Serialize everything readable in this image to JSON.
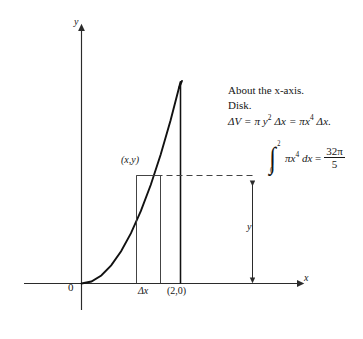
{
  "figure": {
    "title_note": {
      "line1": "About the x-axis.",
      "line2": "Disk.",
      "line3_lhs": "ΔV = π y",
      "line3_exp1": "2",
      "line3_mid": " Δx = πx",
      "line3_exp2": "4",
      "line3_end": " Δx."
    },
    "integral": {
      "upper_limit": "2",
      "lower_limit": "0",
      "integrand": "πx",
      "integrand_exp": "4",
      "differential": "dx",
      "equals": "=",
      "result_numerator": "32π",
      "result_denominator": "5",
      "full_text": "∫₀² πx⁴ dx = 32π/5"
    },
    "labels": {
      "point_xy": "(x,y)",
      "delta_x": "Δx",
      "point_2_0": "(2,0)",
      "origin": "0",
      "y_axis": "y",
      "x_axis": "x",
      "height_y": "y"
    },
    "colors": {
      "curve": "#111111",
      "axis": "#2b2b2b",
      "strip": "#3a3a3a",
      "dashed": "#444444",
      "background": "#ffffff"
    }
  },
  "chart_data": {
    "type": "line",
    "title": "",
    "xlabel": "x",
    "ylabel": "y",
    "function": "y = x^2",
    "x": [
      0,
      0.2,
      0.4,
      0.6,
      0.8,
      1.0,
      1.2,
      1.4,
      1.6,
      1.8,
      2.0
    ],
    "values": [
      0,
      0.04,
      0.16,
      0.36,
      0.64,
      1.0,
      1.44,
      1.96,
      2.56,
      3.24,
      4.0
    ],
    "xlim": [
      0,
      2.2
    ],
    "ylim": [
      0,
      4.4
    ],
    "grid": false,
    "legend": null,
    "annotations": [
      {
        "text": "(x,y)",
        "x": 1.35,
        "y": 2.05,
        "note": "point on curve at top-left of representative strip"
      },
      {
        "text": "Δx",
        "x": 1.5,
        "y": 0,
        "note": "width of representative rectangle, below axis"
      },
      {
        "text": "(2,0)",
        "x": 2.0,
        "y": 0,
        "note": "right endpoint of region on x-axis"
      },
      {
        "text": "0",
        "x": 0,
        "y": 0,
        "note": "origin"
      },
      {
        "text": "y",
        "x": 2.9,
        "y": 1.05,
        "note": "double-headed arrow measuring radius of disk"
      }
    ],
    "shapes": [
      {
        "kind": "rect-strip",
        "x_left": 1.26,
        "x_right": 1.58,
        "y_top": 2.02,
        "y_bottom": 0
      },
      {
        "kind": "vline",
        "x": 2.0,
        "y_from": 0,
        "y_to": 4.0
      },
      {
        "kind": "dashed-hline",
        "y": 2.02,
        "x_from": 1.26,
        "x_to": 3.05
      },
      {
        "kind": "double-arrow",
        "x": 2.95,
        "y_from": 0,
        "y_to": 2.02
      }
    ]
  }
}
